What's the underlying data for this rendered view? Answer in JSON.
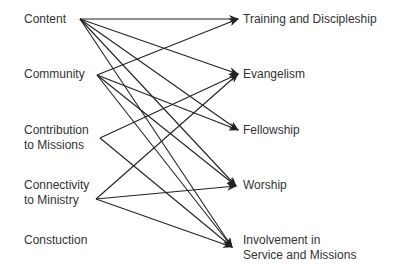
{
  "sources": [
    {
      "label": "Content",
      "x": 24,
      "y": 12,
      "px": 80,
      "py": 19
    },
    {
      "label": "Community",
      "x": 24,
      "y": 67,
      "px": 97,
      "py": 75
    },
    {
      "label": "Contribution\nto Missions",
      "x": 24,
      "y": 123,
      "px": 100,
      "py": 138
    },
    {
      "label": "Connectivity\nto Ministry",
      "x": 24,
      "y": 178,
      "px": 96,
      "py": 199
    },
    {
      "label": "Constuction",
      "x": 24,
      "y": 233,
      "px": null,
      "py": null
    }
  ],
  "targets": [
    {
      "label": "Training and Discipleship",
      "x": 243,
      "y": 12,
      "px": 238,
      "py": 19
    },
    {
      "label": "Evangelism",
      "x": 243,
      "y": 67,
      "px": 238,
      "py": 74
    },
    {
      "label": "Fellowship",
      "x": 243,
      "y": 123,
      "px": 238,
      "py": 130
    },
    {
      "label": "Worship",
      "x": 243,
      "y": 178,
      "px": 236,
      "py": 186
    },
    {
      "label": "Involvement in\nService and Missions",
      "x": 243,
      "y": 233,
      "px": 232,
      "py": 247
    }
  ],
  "edges": [
    [
      0,
      0
    ],
    [
      0,
      1
    ],
    [
      0,
      2
    ],
    [
      0,
      3
    ],
    [
      0,
      4
    ],
    [
      1,
      0
    ],
    [
      1,
      2
    ],
    [
      1,
      3
    ],
    [
      1,
      4
    ],
    [
      2,
      1
    ],
    [
      2,
      4
    ],
    [
      3,
      1
    ],
    [
      3,
      3
    ],
    [
      3,
      4
    ]
  ]
}
